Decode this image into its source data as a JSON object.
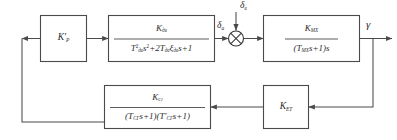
{
  "diagram": {
    "type": "control-system-block-diagram",
    "title": "",
    "line_color": "#4a4a4a",
    "background": "#ffffff",
    "blocks": [
      {
        "id": "gain-ru",
        "name": "controller-gain-block",
        "label_html": "K&#39;<sub class=\"sub-i\">Р</sub>",
        "kind": "gain"
      },
      {
        "id": "actuator",
        "name": "actuator-transfer-block",
        "numerator_html": "K<sub class=\"sub-i\">дв</sub>",
        "denominator_html": "T<sup>2</sup><sub class=\"sub-i\">дв</sub>s<sup>2</sup>+2T<sub class=\"sub-i\">дв</sub>ξ<sub class=\"sub-i\">дв</sub>s+1",
        "kind": "second-order"
      },
      {
        "id": "plant",
        "name": "plant-transfer-block",
        "numerator_html": "K<sub class=\"sub-i\">МХ</sub>",
        "denominator_html": "(T<sub class=\"sub-i\">МХ</sub>s+1)s",
        "kind": "integrating"
      },
      {
        "id": "feedback-filter",
        "name": "feedback-filter-block",
        "numerator_html": "K<sub class=\"sub-i\">сг</sub>",
        "denominator_html": "(T<sub class=\"sub-i\">СГ</sub>s+1)(T&#39;<sub class=\"sub-i\">СГ</sub>s+1)",
        "kind": "second-order-lag"
      },
      {
        "id": "sensor-gain",
        "name": "sensor-gain-block",
        "label_html": "K<sub class=\"sub-i\">ЕТ</sub>",
        "kind": "gain"
      }
    ],
    "signals": [
      {
        "id": "delta-a",
        "name": "actuator-output-signal-label",
        "label_html": "δ<sub class=\"sub-i\">а</sub>"
      },
      {
        "id": "delta-v",
        "name": "disturbance-input-signal-label",
        "label_html": "δ<sub class=\"sub-i\">в</sub>"
      },
      {
        "id": "gamma",
        "name": "output-signal-label",
        "label_html": "γ"
      }
    ],
    "summing_junction": {
      "name": "summing-junction",
      "style": "crossed-circle"
    }
  }
}
